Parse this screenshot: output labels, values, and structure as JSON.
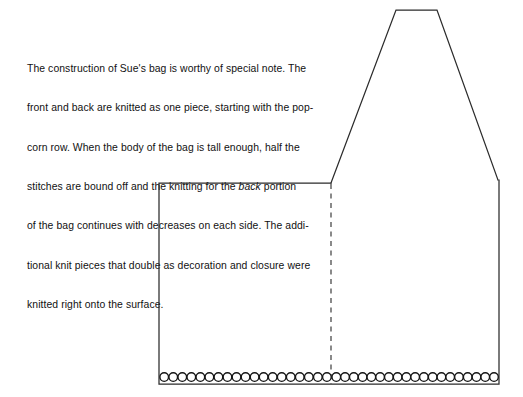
{
  "page": {
    "background_color": "#ffffff",
    "width": 523,
    "height": 397
  },
  "caption": {
    "name": "construction-note",
    "full_text": "The construction of Sue's bag is worthy of special note. The front and back are knitted as one piece, starting with the popcorn row. When the body of the bag is tall enough, half the stitches are bound off and the knitting for the back portion of the bag continues with decreases on each side. The additional knit pieces that double as decoration and closure were knitted right onto the surface.",
    "lines": [
      "The construction of Sue's bag is worthy of special note. The",
      "front and back are knitted as one piece, starting with the pop-",
      "corn row. When the body of the bag is tall enough, half the",
      "of the bag continues with decreases on each side. The addi-",
      "tional knit pieces that double as decoration and closure were",
      "knitted right onto the surface."
    ],
    "line_with_italic": {
      "before": "stitches are bound off and the knitting for the ",
      "italic": "back",
      "after": " portion"
    },
    "text_color": "#111111"
  },
  "diagram": {
    "name": "bag-schematic",
    "line_color": "#2b2b2b",
    "stitch_fill": "#ffffff",
    "stitch_stroke": "#141414",
    "body": {
      "name": "bag-body-outline",
      "description": "rectangular front/back body of the bag",
      "left": 159,
      "right": 499,
      "top": 183,
      "bottom": 384
    },
    "flap": {
      "name": "bag-flap-outline",
      "description": "tapered flap rising from the back half of the bag",
      "points": "331,183 396,10 437,10 498,180"
    },
    "fold_line": {
      "name": "fold-dashed-line",
      "description": "dashed vertical line marking the fold between front and back",
      "x": 331,
      "y_top": 183,
      "y_bottom": 384,
      "dash": "5 4.5"
    },
    "popcorn_row": {
      "name": "popcorn-stitch-row",
      "description": "row of popcorn stitches along the cast-on edge",
      "y_center": 377,
      "radius": 4.3,
      "spacing": 9.05,
      "left_section": {
        "name": "popcorn-row-front",
        "count": 19,
        "x_start": 164.2,
        "x_end": 326.9
      },
      "right_section": {
        "name": "popcorn-row-back",
        "count": 19,
        "x_start": 336.3,
        "x_end": 494.0
      },
      "total_count": 38
    }
  }
}
